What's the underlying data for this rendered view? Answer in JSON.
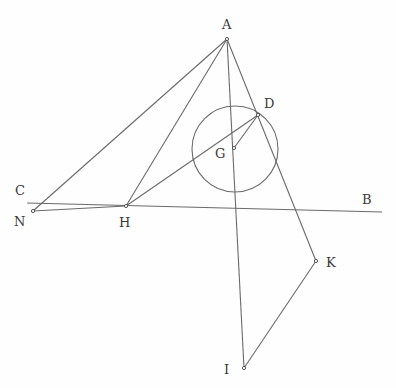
{
  "diagram": {
    "type": "geometric-construction",
    "points": {
      "A": {
        "x": 227,
        "y": 39,
        "label": "A",
        "lx": 222,
        "ly": 29
      },
      "B": {
        "x": 382,
        "y": 212,
        "label": "B",
        "lx": 362,
        "ly": 204
      },
      "C": {
        "x": 27,
        "y": 203,
        "label": "C",
        "lx": 15,
        "ly": 195
      },
      "D": {
        "x": 258,
        "y": 115,
        "label": "D",
        "lx": 264,
        "ly": 108
      },
      "G": {
        "x": 234,
        "y": 148,
        "label": "G",
        "lx": 215,
        "ly": 158
      },
      "H": {
        "x": 126,
        "y": 206,
        "label": "H",
        "lx": 119,
        "ly": 227
      },
      "N": {
        "x": 33,
        "y": 211,
        "label": "N",
        "lx": 14,
        "ly": 226
      },
      "K": {
        "x": 316,
        "y": 261,
        "label": "K",
        "lx": 326,
        "ly": 267
      },
      "I": {
        "x": 244,
        "y": 368,
        "label": "I",
        "lx": 224,
        "ly": 374
      }
    },
    "circle": {
      "center": "G",
      "cx": 235,
      "cy": 149,
      "r": 43
    },
    "segments": [
      [
        "C",
        "B"
      ],
      [
        "A",
        "N"
      ],
      [
        "A",
        "H"
      ],
      [
        "A",
        "I"
      ],
      [
        "A",
        "K"
      ],
      [
        "N",
        "H"
      ],
      [
        "H",
        "D"
      ],
      [
        "G",
        "D"
      ],
      [
        "K",
        "I"
      ]
    ],
    "stroke_color": "#6a6a6a",
    "label_color": "#3a3a3a"
  }
}
